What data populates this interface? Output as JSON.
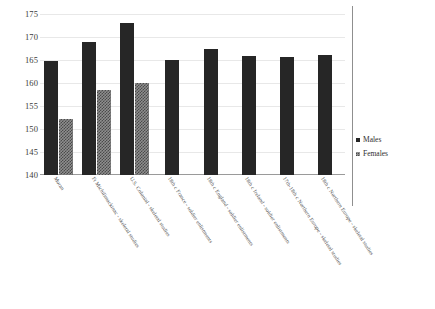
{
  "chart_data": {
    "type": "bar",
    "title": "",
    "xlabel": "",
    "ylabel": "",
    "ylim": [
      140,
      175
    ],
    "ytick_step": 5,
    "yticks": [
      175,
      170,
      165,
      160,
      155,
      150,
      145,
      140
    ],
    "grid": true,
    "legend_position": "right",
    "categories": [
      "Moran",
      "Ft Michilimackinac - skeletal studies",
      "U.S. Colonial - skeletal studies",
      "18th c France - soldier enlistments",
      "18th c England - soldier enlistments",
      "18th c Ireland - soldier enlistments",
      "17th-18th c Northern Europe - skeletal studies",
      "18th c Northern Europe - skeletal studies"
    ],
    "series": [
      {
        "name": "Males",
        "color": "#262626",
        "values": [
          164.8,
          169.0,
          173.0,
          165.0,
          167.4,
          165.8,
          165.7,
          166.1
        ]
      },
      {
        "name": "Females",
        "color": "#8e8e8e",
        "values": [
          152.2,
          158.5,
          160.0,
          null,
          null,
          null,
          null,
          null
        ]
      }
    ]
  },
  "legend": {
    "items": [
      {
        "label": "Males"
      },
      {
        "label": "Females"
      }
    ]
  }
}
